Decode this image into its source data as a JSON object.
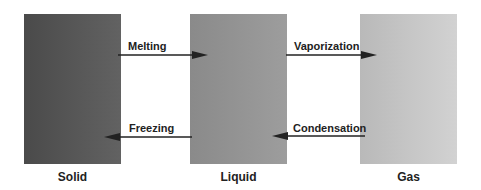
{
  "states": [
    {
      "label": "Solid",
      "color": "#555555"
    },
    {
      "label": "Liquid",
      "color": "#939393"
    },
    {
      "label": "Gas",
      "color": "#c5c5c5"
    }
  ],
  "transitions": {
    "melting": "Melting",
    "freezing": "Freezing",
    "vaporization": "Vaporization",
    "condensation": "Condensation"
  }
}
